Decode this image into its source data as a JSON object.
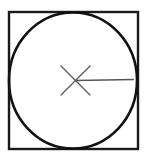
{
  "canvas": {
    "width": 147,
    "height": 160,
    "background": "#ffffff"
  },
  "figure": {
    "type": "geometric-line-drawing"
  },
  "shapes": {
    "square": {
      "name": "square",
      "x": 9,
      "y": 12,
      "width": 129,
      "height": 137,
      "stroke": "#1a1a1a",
      "stroke_width": 2.4,
      "fill": "none"
    },
    "circle": {
      "name": "inscribed-circle",
      "cx": 73,
      "cy": 80.5,
      "r": 64,
      "rx": 64,
      "ry": 68,
      "stroke": "#111111",
      "stroke_width": 2.6,
      "fill": "none"
    },
    "center_mark": {
      "name": "center-x-mark",
      "cx": 75.5,
      "cy": 80.5,
      "half_extent": 15,
      "stroke": "#5a5a5a",
      "stroke_width": 1.3,
      "stroke_1": {
        "x1": 61,
        "y1": 66,
        "x2": 90,
        "y2": 95
      },
      "stroke_2": {
        "x1": 90,
        "y1": 66,
        "x2": 61,
        "y2": 95
      }
    },
    "radius_line": {
      "name": "radius-line",
      "x1": 75.5,
      "y1": 80.5,
      "x2": 134,
      "y2": 79.5,
      "stroke": "#555555",
      "stroke_width": 1.4,
      "length": 58.5
    }
  },
  "colors": {
    "ink": "#111111",
    "ink_soft": "#555555",
    "paper": "#ffffff"
  }
}
